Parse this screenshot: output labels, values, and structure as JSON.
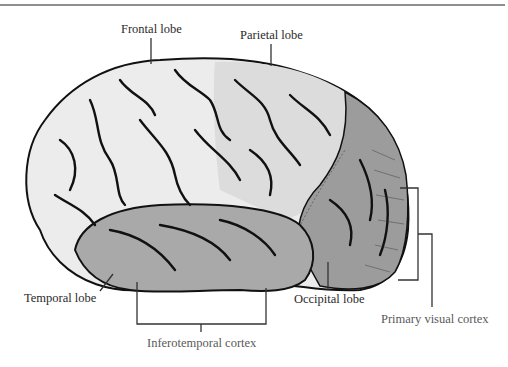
{
  "figure": {
    "labels": {
      "frontal": "Frontal lobe",
      "parietal": "Parietal lobe",
      "temporal": "Temporal lobe",
      "occipital": "Occipital lobe",
      "primary_visual": "Primary visual cortex",
      "inferotemporal": "Inferotemporal cortex"
    },
    "colors": {
      "frontal_fill": "#ececec",
      "parietal_fill": "#dcdcdc",
      "temporal_fill": "#a9a9a9",
      "occipital_fill": "#9c9c9c",
      "outline": "#111111",
      "leader": "#333333",
      "rule": "#8e8e8e"
    }
  }
}
